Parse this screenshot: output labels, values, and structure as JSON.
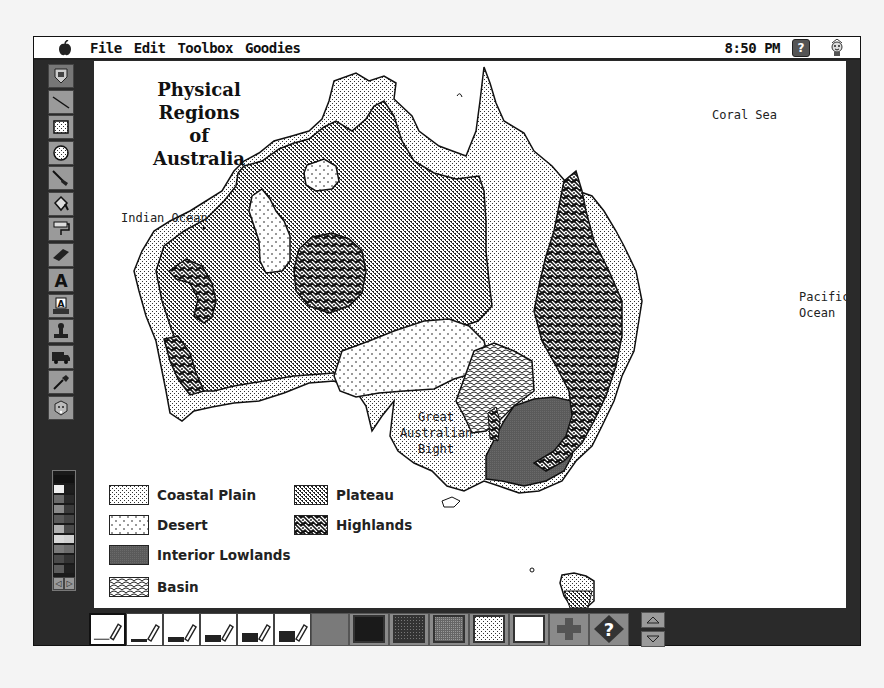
{
  "menubar": {
    "apple_icon": "apple-icon",
    "items": [
      "File",
      "Edit",
      "Toolbox",
      "Goodies"
    ],
    "clock": "8:50 PM",
    "help_icon": "help-icon",
    "help_label": "?",
    "mascot_icon": "stamp-mascot-icon"
  },
  "toolbox": {
    "tools": [
      {
        "name": "magic-tool",
        "icon": "magic-wand-shield-icon"
      },
      {
        "name": "line-tool",
        "icon": "line-icon"
      },
      {
        "name": "rectangle-tool",
        "icon": "rectangle-icon"
      },
      {
        "name": "oval-tool",
        "icon": "oval-icon"
      },
      {
        "name": "brush-tool",
        "icon": "brush-icon"
      },
      {
        "name": "paint-bucket-tool",
        "icon": "paint-bucket-icon"
      },
      {
        "name": "paint-roller-tool",
        "icon": "paint-roller-icon"
      },
      {
        "name": "eraser-tool",
        "icon": "eraser-icon"
      },
      {
        "name": "text-tool",
        "icon": "text-a-icon",
        "glyph": "A"
      },
      {
        "name": "keyboard-text-tool",
        "icon": "keyboard-text-icon",
        "glyph": "A"
      },
      {
        "name": "stamp-tool",
        "icon": "rubber-stamp-icon"
      },
      {
        "name": "truck-tool",
        "icon": "truck-icon"
      },
      {
        "name": "eyedropper-tool",
        "icon": "eyedropper-icon"
      },
      {
        "name": "undo-guy-tool",
        "icon": "undo-face-icon"
      }
    ]
  },
  "color_palette": {
    "left_column": [
      "#111111",
      "#f0f0f0",
      "#6a6a6a",
      "#8a8a8a",
      "#5a5a5a",
      "#b0b0b0",
      "#d8d8d8",
      "#7a7a7a",
      "#4a4a4a",
      "#5c5c5c"
    ],
    "right_column": [
      "#111111",
      "#1e1e1e",
      "#2a2a2a",
      "#3a3a3a",
      "#444444",
      "#4a4a4a",
      "#d0d0d0",
      "#6c6c6c",
      "#333333",
      "#202020"
    ],
    "prev_label": "◁",
    "next_label": "▷"
  },
  "map": {
    "title_line1": "Physical Regions",
    "title_line2": "of",
    "title_line3": "Australia",
    "labels": {
      "indian_ocean": "Indian Ocean",
      "coral_sea": "Coral Sea",
      "pacific_line1": "Pacific",
      "pacific_line2": "Ocean",
      "bight_line1": "Great",
      "bight_line2": "Australian",
      "bight_line3": "Bight"
    },
    "legend": [
      {
        "label": "Coastal Plain",
        "pattern": "fine-dots"
      },
      {
        "label": "Plateau",
        "pattern": "dense-dots"
      },
      {
        "label": "Desert",
        "pattern": "sparse-diamonds"
      },
      {
        "label": "Highlands",
        "pattern": "woven"
      },
      {
        "label": "Interior Lowlands",
        "pattern": "solid-gray"
      },
      {
        "label": "Basin",
        "pattern": "scales"
      }
    ]
  },
  "bottombar": {
    "brush_sizes": [
      {
        "name": "brush-size-1",
        "thickness": 1,
        "selected": true
      },
      {
        "name": "brush-size-2",
        "thickness": 3,
        "selected": false
      },
      {
        "name": "brush-size-3",
        "thickness": 5,
        "selected": false
      },
      {
        "name": "brush-size-4",
        "thickness": 7,
        "selected": false
      },
      {
        "name": "brush-size-5",
        "thickness": 9,
        "selected": false
      },
      {
        "name": "brush-size-6",
        "thickness": 11,
        "selected": false
      }
    ],
    "fill_patterns": [
      {
        "name": "fill-black",
        "color": "#1a1a1a"
      },
      {
        "name": "fill-dark-texture",
        "color": "#4a4a4a"
      },
      {
        "name": "fill-medium-texture",
        "color": "#7a7a7a"
      },
      {
        "name": "fill-light-dots",
        "color": "#d8d8d8"
      },
      {
        "name": "fill-white",
        "color": "#ffffff"
      }
    ],
    "extra_icon": "cross-icon",
    "help_diamond_label": "?",
    "scroll_up": "up-arrow-icon",
    "scroll_down": "down-arrow-icon"
  }
}
